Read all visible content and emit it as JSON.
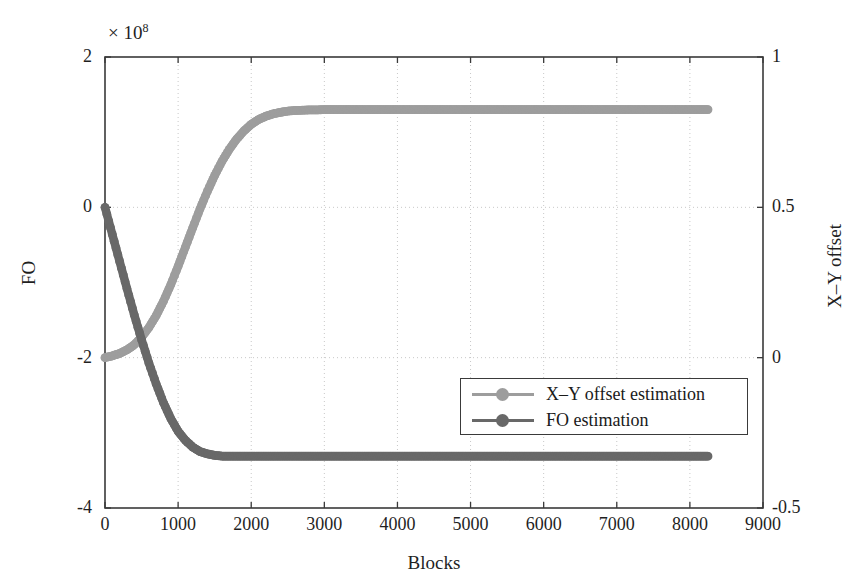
{
  "chart_data": {
    "type": "line",
    "title": "",
    "xlabel": "Blocks",
    "ylabel": "FO",
    "ylabel_right": "X–Y offset",
    "y_exponent_label": "× 10",
    "y_exponent_power": "8",
    "xlim": [
      0,
      9000
    ],
    "ylim": [
      -4,
      2
    ],
    "ylim_right": [
      -0.5,
      1
    ],
    "xticks": [
      0,
      1000,
      2000,
      3000,
      4000,
      5000,
      6000,
      7000,
      8000,
      9000
    ],
    "xticklabels": [
      "0",
      "1000",
      "2000",
      "3000",
      "4000",
      "5000",
      "6000",
      "7000",
      "8000",
      "9000"
    ],
    "yticks": [
      -4,
      -2,
      0,
      2
    ],
    "yticklabels": [
      "-4",
      "-2",
      "0",
      "2"
    ],
    "yticks_right": [
      -0.5,
      0,
      0.5,
      1
    ],
    "yticklabels_right": [
      "-0.5",
      "0",
      "0.5",
      "1"
    ],
    "grid": true,
    "grid_style": "dotted",
    "legend_position": "center-right",
    "series": [
      {
        "name": "X–Y offset estimation",
        "color": "#9d9d9d",
        "axis": "right",
        "x": [
          0,
          100,
          200,
          300,
          400,
          500,
          600,
          700,
          800,
          900,
          1000,
          1100,
          1200,
          1300,
          1400,
          1500,
          1600,
          1700,
          1800,
          1900,
          2000,
          2100,
          2200,
          2300,
          2400,
          2500,
          2600,
          2700,
          2800,
          2900,
          3000,
          3500,
          4000,
          4500,
          5000,
          5500,
          6000,
          6500,
          7000,
          7500,
          8000,
          8250
        ],
        "values": [
          0.0,
          0.006,
          0.014,
          0.026,
          0.043,
          0.068,
          0.1,
          0.14,
          0.188,
          0.243,
          0.304,
          0.368,
          0.432,
          0.495,
          0.553,
          0.606,
          0.653,
          0.693,
          0.727,
          0.754,
          0.776,
          0.792,
          0.803,
          0.811,
          0.816,
          0.82,
          0.822,
          0.823,
          0.824,
          0.824,
          0.825,
          0.825,
          0.825,
          0.825,
          0.825,
          0.825,
          0.825,
          0.825,
          0.825,
          0.825,
          0.825,
          0.825
        ]
      },
      {
        "name": "FO estimation",
        "color": "#686868",
        "axis": "left",
        "x": [
          0,
          100,
          200,
          300,
          400,
          500,
          600,
          700,
          800,
          900,
          1000,
          1100,
          1200,
          1300,
          1400,
          1500,
          1600,
          1800,
          2000,
          2500,
          3000,
          3500,
          4000,
          4500,
          5000,
          5500,
          6000,
          6500,
          7000,
          7500,
          8000,
          8250
        ],
        "values": [
          0.0,
          -0.36,
          -0.72,
          -1.08,
          -1.43,
          -1.76,
          -2.07,
          -2.35,
          -2.6,
          -2.81,
          -2.98,
          -3.1,
          -3.19,
          -3.25,
          -3.28,
          -3.3,
          -3.31,
          -3.31,
          -3.31,
          -3.31,
          -3.31,
          -3.31,
          -3.31,
          -3.31,
          -3.31,
          -3.31,
          -3.31,
          -3.31,
          -3.31,
          -3.31,
          -3.31,
          -3.31
        ]
      }
    ]
  },
  "legend": {
    "entries": [
      {
        "label": "X–Y offset estimation",
        "color": "#9d9d9d"
      },
      {
        "label": "FO estimation",
        "color": "#686868"
      }
    ]
  },
  "colors": {
    "axis": "#3a3a3a",
    "grid": "#c8c8c8",
    "text": "#1a1a1a",
    "background": "#ffffff"
  }
}
